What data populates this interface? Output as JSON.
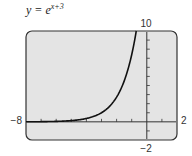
{
  "title": {
    "lhs": "y = e",
    "exponent": "x+3"
  },
  "window": {
    "xmin_label": "−8",
    "xmax_label": "2",
    "ymin_label": "−2",
    "ymax_label": "10"
  },
  "colors": {
    "screen_bg": "#e4e4e4",
    "frame": "#333333",
    "curve": "#111111"
  },
  "chart_data": {
    "type": "line",
    "xlabel": "",
    "ylabel": "",
    "xlim": [
      -8,
      2
    ],
    "ylim": [
      -2,
      10
    ],
    "xticks_step": 1,
    "yticks_step": 1,
    "grid": false,
    "legend": null,
    "series": [
      {
        "name": "y = e^(x+3)",
        "x": [
          -8,
          -7,
          -6,
          -5,
          -4,
          -3,
          -2,
          -1,
          -0.8,
          -0.7
        ],
        "y": [
          0.0067,
          0.018,
          0.05,
          0.135,
          0.368,
          1.0,
          2.718,
          7.389,
          9.025,
          9.974
        ]
      }
    ]
  }
}
